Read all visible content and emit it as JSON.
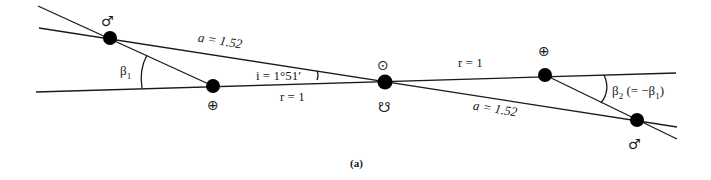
{
  "diagram": {
    "caption": "(a)",
    "labels": {
      "mars_orbit_left": "a = 1.52",
      "mars_orbit_right": "a = 1.52",
      "earth_orbit_left": "r = 1",
      "earth_orbit_right": "r = 1",
      "inclination": "i = 1°51′",
      "beta1": "β",
      "beta1_sub": "1",
      "beta2": "β",
      "beta2_sub": "2",
      "beta2_paren": " (= −β",
      "beta2_paren_sub": "1",
      "beta2_close": ")"
    },
    "symbols": {
      "mars_left": "♂",
      "mars_right": "♂",
      "earth_left": "⊕",
      "earth_right": "⊕",
      "sun": "⊙",
      "node": "☋"
    }
  }
}
